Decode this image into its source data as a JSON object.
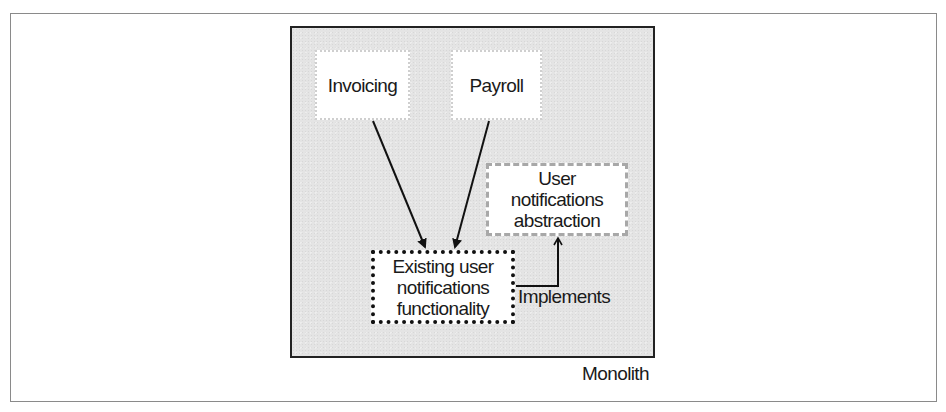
{
  "diagram": {
    "container": {
      "label": "Monolith"
    },
    "nodes": [
      {
        "id": "invoicing",
        "label": "Invoicing",
        "style": "light-dotted"
      },
      {
        "id": "payroll",
        "label": "Payroll",
        "style": "light-dotted"
      },
      {
        "id": "abstraction",
        "label": "User notifications abstraction",
        "lines": [
          "User",
          "notifications",
          "abstraction"
        ],
        "style": "gray-dashed"
      },
      {
        "id": "existing",
        "label": "Existing user notifications functionality",
        "lines": [
          "Existing user",
          "notifications",
          "functionality"
        ],
        "style": "black-dotted"
      }
    ],
    "edges": [
      {
        "from": "invoicing",
        "to": "existing",
        "label": ""
      },
      {
        "from": "payroll",
        "to": "existing",
        "label": ""
      },
      {
        "from": "existing",
        "to": "abstraction",
        "label": "Implements"
      }
    ],
    "colors": {
      "container_fill": "#e4e4e4",
      "container_border": "#222222",
      "node_fill": "#ffffff",
      "arrow": "#111111",
      "abstraction_border": "#a8a8a8"
    }
  }
}
